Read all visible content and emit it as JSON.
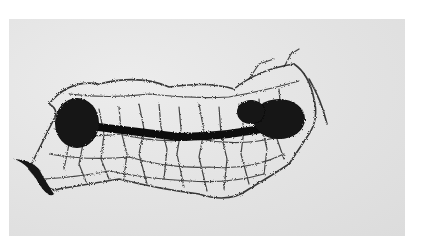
{
  "image": {
    "description": "Black-and-white photograph of a dense branching network (vascular/dendritic cast) with two dark oval masses connected by a dark central bar",
    "background_color": "#ffffff",
    "photo_background_color": "#e4e4e4",
    "subject_color": "#141414"
  }
}
